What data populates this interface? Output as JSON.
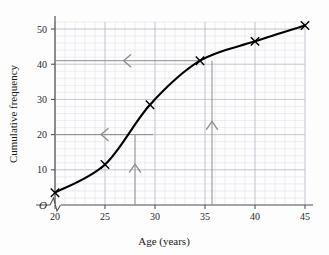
{
  "chart_data": {
    "type": "line",
    "title": "",
    "xlabel": "Age (years)",
    "ylabel": "Cumulative frequency",
    "xlim": [
      20,
      45
    ],
    "ylim": [
      0,
      52
    ],
    "x_ticks": [
      "20",
      "25",
      "30",
      "35",
      "40",
      "45"
    ],
    "x_tick_values": [
      20,
      25,
      30,
      35,
      40,
      45
    ],
    "y_ticks": [
      "10",
      "20",
      "30",
      "40",
      "50"
    ],
    "y_tick_values": [
      10,
      20,
      30,
      40,
      50
    ],
    "origin_label": "O",
    "axis_break": true,
    "grid": "minor-and-major",
    "x_minor_step": 1,
    "y_minor_step": 2,
    "legend": "none",
    "series": [
      {
        "name": "Cumulative frequency",
        "marker": "x",
        "x": [
          20,
          25,
          29.5,
          34.5,
          40,
          45
        ],
        "values": [
          3.5,
          11.5,
          28.5,
          41,
          46.5,
          51
        ]
      }
    ],
    "annotations": [
      {
        "name": "median-read-off-horizontal",
        "type": "arrow",
        "direction": "left",
        "from": [
          29.8,
          20
        ],
        "to": [
          20,
          20
        ],
        "color": "#8c8c8c"
      },
      {
        "name": "median-read-off-vertical",
        "type": "arrow",
        "direction": "up",
        "from": [
          28,
          0
        ],
        "to": [
          28,
          20
        ],
        "color": "#8c8c8c"
      },
      {
        "name": "upper-read-off-horizontal",
        "type": "arrow",
        "direction": "left",
        "from": [
          34.6,
          41
        ],
        "to": [
          20,
          41
        ],
        "color": "#8c8c8c"
      },
      {
        "name": "upper-read-off-vertical",
        "type": "arrow",
        "direction": "up",
        "from": [
          35.7,
          0
        ],
        "to": [
          35.7,
          41
        ],
        "color": "#8c8c8c"
      }
    ],
    "colors": {
      "curve": "#000000",
      "marker": "#000000",
      "axis": "#555555",
      "grid_major": "#b8b8c8",
      "grid_minor": "#dcdce8",
      "annotation": "#8c8c8c",
      "background": "#fdfdfd"
    }
  }
}
